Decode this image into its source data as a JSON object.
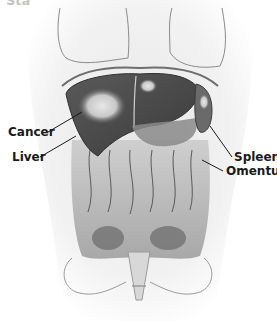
{
  "figure": {
    "title": "Stage III",
    "labels": {
      "cancer": "Cancer",
      "liver": "Liver",
      "spleen": "Spleen",
      "omentum": "Omentum"
    },
    "colors": {
      "organ_dark": "#4a4a4a",
      "organ_mid": "#8a8a8a",
      "body_outline": "#6e6e6e",
      "background": "#ffffff",
      "label_text": "#1a1a1a"
    }
  }
}
